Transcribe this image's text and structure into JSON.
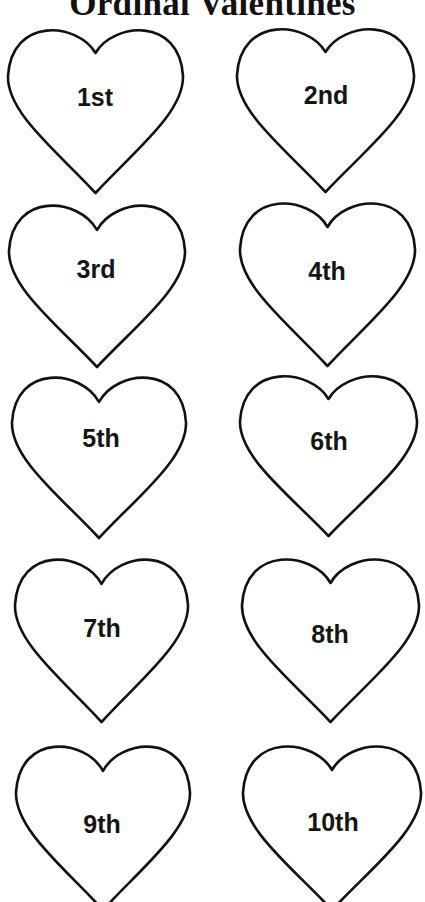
{
  "title": "Ordinal Valentines",
  "hearts": [
    {
      "label": "1st"
    },
    {
      "label": "2nd"
    },
    {
      "label": "3rd"
    },
    {
      "label": "4th"
    },
    {
      "label": "5th"
    },
    {
      "label": "6th"
    },
    {
      "label": "7th"
    },
    {
      "label": "8th"
    },
    {
      "label": "9th"
    },
    {
      "label": "10th"
    }
  ]
}
